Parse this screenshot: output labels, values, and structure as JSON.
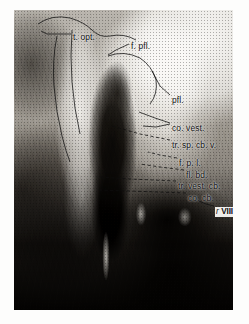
{
  "figure": {
    "kind": "histological-micrograph",
    "plate_background": "#8d8a85",
    "margin_background": "#fdfdfc",
    "label_color": "#111111",
    "leader_color": "#0d0d0d"
  },
  "labels": [
    {
      "id": "t-opt",
      "text": "t. opt.",
      "x": 73,
      "y": 33,
      "leader": "solid"
    },
    {
      "id": "f-pfl",
      "text": "f. pfl.",
      "x": 131,
      "y": 42,
      "leader": "solid"
    },
    {
      "id": "pfl",
      "text": "pfl.",
      "x": 172,
      "y": 96,
      "leader": "solid"
    },
    {
      "id": "co-vest",
      "text": "co. vest.",
      "x": 172,
      "y": 124,
      "leader": "solid"
    },
    {
      "id": "tr-sp-cb-v",
      "text": "tr. sp. cb. v.",
      "x": 172,
      "y": 141,
      "leader": "dashed"
    },
    {
      "id": "f-p-l",
      "text": "f. p. l.",
      "x": 179,
      "y": 159,
      "leader": "dashed"
    },
    {
      "id": "fl-bd",
      "text": "fl. bd.",
      "x": 186,
      "y": 171,
      "leader": "dashed"
    },
    {
      "id": "tr-vest-cb",
      "text": "tr. vest. cb.",
      "x": 178,
      "y": 182,
      "leader": "dashed"
    },
    {
      "id": "co-cb",
      "text": "co. cb.",
      "x": 188,
      "y": 194,
      "leader": "dashed"
    }
  ],
  "roman_label": {
    "id": "r-viii",
    "prefix": "r ",
    "numeral": "VIII",
    "x": 215,
    "y": 207
  }
}
